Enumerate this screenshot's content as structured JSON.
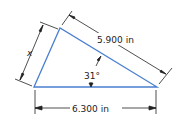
{
  "diagram": {
    "shape": "triangle",
    "colors": {
      "triangle": "#4a7fd0",
      "dimension": "#222222"
    },
    "labels": {
      "side_left": "x",
      "side_hypotenuse": "5.900 in",
      "side_bottom": "6.300 in",
      "angle": "31°"
    }
  }
}
